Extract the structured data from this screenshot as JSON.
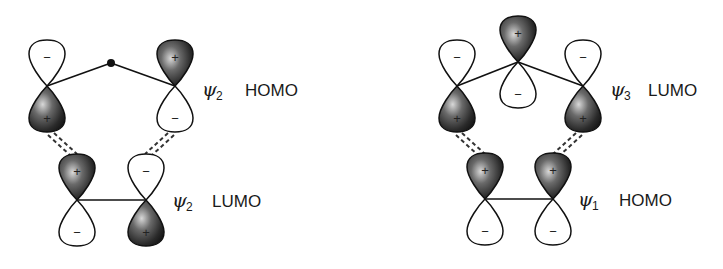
{
  "diagram": {
    "type": "molecular-orbital-interaction",
    "colors": {
      "positive_lobe": "#222222",
      "negative_lobe": "#ffffff",
      "outline": "#111111"
    },
    "left_panel": {
      "upper_fragment": {
        "psi_symbol": "ψ",
        "psi_subscript": "2",
        "label": "HOMO",
        "lobes": [
          {
            "position": "left",
            "top_sign": "−",
            "bottom_sign": "+"
          },
          {
            "position": "right",
            "top_sign": "+",
            "bottom_sign": "−"
          }
        ],
        "central_node": "dot"
      },
      "lower_fragment": {
        "psi_symbol": "ψ",
        "psi_subscript": "2",
        "label": "LUMO",
        "lobes": [
          {
            "position": "left",
            "top_sign": "+",
            "bottom_sign": "−"
          },
          {
            "position": "right",
            "top_sign": "−",
            "bottom_sign": "+"
          }
        ]
      }
    },
    "right_panel": {
      "upper_fragment": {
        "psi_symbol": "ψ",
        "psi_subscript": "3",
        "label": "LUMO",
        "lobes": [
          {
            "position": "left",
            "top_sign": "−",
            "bottom_sign": "+"
          },
          {
            "position": "center",
            "top_sign": "+",
            "bottom_sign": "−"
          },
          {
            "position": "right",
            "top_sign": "−",
            "bottom_sign": "+"
          }
        ]
      },
      "lower_fragment": {
        "psi_symbol": "ψ",
        "psi_subscript": "1",
        "label": "HOMO",
        "lobes": [
          {
            "position": "left",
            "top_sign": "+",
            "bottom_sign": "−"
          },
          {
            "position": "right",
            "top_sign": "+",
            "bottom_sign": "−"
          }
        ]
      }
    }
  }
}
